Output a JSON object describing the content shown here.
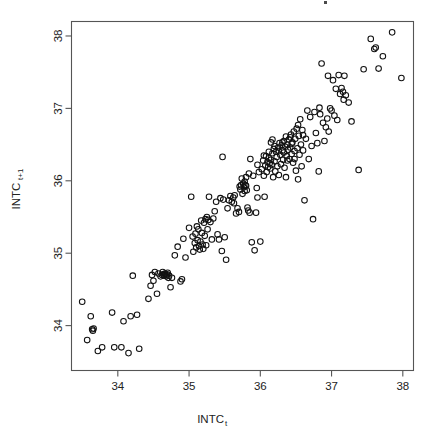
{
  "figure": {
    "kind": "scatterplot",
    "background_color": "#ffffff",
    "width": 429,
    "height": 436,
    "title": ""
  },
  "axes": {
    "frame_color": "#555555",
    "x": {
      "label_base": "INTC",
      "label_sub": "t",
      "ticks": [
        "34",
        "35",
        "36",
        "37",
        "38"
      ],
      "tick_values": [
        34,
        35,
        36,
        37,
        38
      ],
      "range": [
        33.35,
        38.15
      ]
    },
    "y": {
      "label_base": "INTC",
      "label_sub": "t+1",
      "ticks": [
        "34",
        "35",
        "36",
        "37",
        "38"
      ],
      "tick_values": [
        34,
        35,
        36,
        37,
        38
      ],
      "range": [
        33.38,
        38.2
      ]
    }
  },
  "marker": {
    "shape": "open-circle",
    "radius_px": 2.8,
    "stroke_color": "#111111",
    "stroke_width": 1.05,
    "fill": "none"
  },
  "chart_data": {
    "type": "scatter",
    "title": "",
    "xlabel": "INTC_t",
    "ylabel": "INTC_t+1",
    "xlim": [
      33.35,
      38.15
    ],
    "ylim": [
      33.38,
      38.2
    ],
    "grid": false,
    "legend": false,
    "series": [
      {
        "name": "INTC lag-1 scatter",
        "marker": "open-circle",
        "color": "#111111",
        "n_points": 232,
        "points": [
          [
            33.5,
            34.33
          ],
          [
            33.57,
            33.8
          ],
          [
            33.62,
            34.13
          ],
          [
            33.64,
            33.95
          ],
          [
            33.65,
            33.93
          ],
          [
            33.66,
            33.96
          ],
          [
            33.72,
            33.65
          ],
          [
            33.78,
            33.7
          ],
          [
            33.92,
            34.18
          ],
          [
            33.95,
            33.7
          ],
          [
            34.05,
            33.7
          ],
          [
            34.08,
            34.06
          ],
          [
            34.15,
            33.62
          ],
          [
            34.18,
            34.13
          ],
          [
            34.21,
            34.69
          ],
          [
            34.27,
            34.15
          ],
          [
            34.3,
            33.68
          ],
          [
            34.43,
            34.37
          ],
          [
            34.46,
            34.55
          ],
          [
            34.48,
            34.7
          ],
          [
            34.5,
            34.62
          ],
          [
            34.52,
            34.74
          ],
          [
            34.55,
            34.44
          ],
          [
            34.57,
            34.72
          ],
          [
            34.6,
            34.68
          ],
          [
            34.62,
            34.7
          ],
          [
            34.64,
            34.71
          ],
          [
            34.65,
            34.69
          ],
          [
            34.66,
            34.72
          ],
          [
            34.67,
            34.7
          ],
          [
            34.68,
            34.68
          ],
          [
            34.69,
            34.71
          ],
          [
            34.7,
            34.73
          ],
          [
            34.72,
            34.69
          ],
          [
            34.74,
            34.53
          ],
          [
            34.76,
            34.66
          ],
          [
            34.8,
            34.97
          ],
          [
            34.84,
            35.09
          ],
          [
            34.88,
            34.61
          ],
          [
            34.9,
            34.64
          ],
          [
            34.92,
            35.2
          ],
          [
            34.95,
            34.94
          ],
          [
            35.0,
            35.35
          ],
          [
            35.03,
            35.78
          ],
          [
            35.05,
            35.23
          ],
          [
            35.06,
            35.02
          ],
          [
            35.08,
            35.14
          ],
          [
            35.1,
            35.08
          ],
          [
            35.11,
            35.37
          ],
          [
            35.12,
            35.18
          ],
          [
            35.14,
            35.1
          ],
          [
            35.15,
            35.05
          ],
          [
            35.16,
            35.16
          ],
          [
            35.17,
            35.45
          ],
          [
            35.18,
            35.28
          ],
          [
            35.19,
            35.12
          ],
          [
            35.2,
            35.06
          ],
          [
            35.21,
            35.42
          ],
          [
            35.22,
            35.24
          ],
          [
            35.23,
            35.47
          ],
          [
            35.24,
            35.11
          ],
          [
            35.25,
            35.5
          ],
          [
            35.26,
            35.33
          ],
          [
            35.27,
            35.46
          ],
          [
            35.28,
            35.78
          ],
          [
            35.3,
            35.43
          ],
          [
            35.32,
            35.19
          ],
          [
            35.34,
            35.48
          ],
          [
            35.36,
            35.58
          ],
          [
            35.38,
            35.71
          ],
          [
            35.4,
            35.26
          ],
          [
            35.42,
            35.19
          ],
          [
            35.44,
            35.76
          ],
          [
            35.46,
            35.03
          ],
          [
            35.47,
            36.33
          ],
          [
            35.48,
            35.74
          ],
          [
            35.5,
            35.22
          ],
          [
            35.52,
            34.91
          ],
          [
            35.54,
            35.62
          ],
          [
            35.56,
            35.73
          ],
          [
            35.58,
            35.79
          ],
          [
            35.6,
            35.71
          ],
          [
            35.62,
            35.77
          ],
          [
            35.63,
            35.69
          ],
          [
            35.64,
            35.8
          ],
          [
            35.66,
            35.55
          ],
          [
            35.68,
            35.62
          ],
          [
            35.7,
            35.57
          ],
          [
            35.71,
            35.92
          ],
          [
            35.72,
            35.88
          ],
          [
            35.73,
            35.94
          ],
          [
            35.74,
            36.03
          ],
          [
            35.75,
            35.82
          ],
          [
            35.76,
            35.96
          ],
          [
            35.77,
            35.91
          ],
          [
            35.78,
            35.99
          ],
          [
            35.79,
            35.94
          ],
          [
            35.8,
            36.05
          ],
          [
            35.81,
            35.87
          ],
          [
            35.82,
            35.63
          ],
          [
            35.83,
            35.59
          ],
          [
            35.84,
            36.1
          ],
          [
            35.85,
            35.56
          ],
          [
            35.86,
            36.3
          ],
          [
            35.88,
            35.15
          ],
          [
            35.9,
            36.07
          ],
          [
            35.92,
            35.04
          ],
          [
            35.94,
            35.56
          ],
          [
            35.95,
            35.9
          ],
          [
            35.96,
            35.77
          ],
          [
            35.98,
            36.12
          ],
          [
            36.0,
            35.16
          ],
          [
            36.02,
            36.16
          ],
          [
            36.04,
            36.28
          ],
          [
            36.05,
            36.07
          ],
          [
            36.06,
            35.78
          ],
          [
            36.07,
            36.21
          ],
          [
            36.08,
            36.34
          ],
          [
            36.09,
            36.12
          ],
          [
            36.1,
            36.26
          ],
          [
            36.11,
            36.19
          ],
          [
            36.12,
            36.31
          ],
          [
            36.13,
            36.24
          ],
          [
            36.14,
            36.17
          ],
          [
            36.15,
            36.29
          ],
          [
            36.16,
            36.22
          ],
          [
            36.17,
            36.38
          ],
          [
            36.18,
            36.05
          ],
          [
            36.19,
            36.44
          ],
          [
            36.2,
            36.27
          ],
          [
            36.21,
            36.13
          ],
          [
            36.22,
            36.4
          ],
          [
            36.23,
            36.33
          ],
          [
            36.24,
            36.2
          ],
          [
            36.25,
            36.46
          ],
          [
            36.26,
            36.08
          ],
          [
            36.27,
            36.52
          ],
          [
            36.28,
            36.36
          ],
          [
            36.29,
            36.23
          ],
          [
            36.3,
            36.49
          ],
          [
            36.31,
            36.42
          ],
          [
            36.32,
            36.29
          ],
          [
            36.33,
            36.55
          ],
          [
            36.34,
            36.18
          ],
          [
            36.35,
            36.47
          ],
          [
            36.36,
            36.61
          ],
          [
            36.37,
            36.34
          ],
          [
            36.38,
            36.5
          ],
          [
            36.39,
            36.43
          ],
          [
            36.4,
            36.57
          ],
          [
            36.41,
            36.3
          ],
          [
            36.42,
            36.46
          ],
          [
            36.43,
            36.64
          ],
          [
            36.44,
            36.37
          ],
          [
            36.45,
            36.53
          ],
          [
            36.46,
            36.25
          ],
          [
            36.47,
            36.68
          ],
          [
            36.48,
            36.41
          ],
          [
            36.49,
            36.58
          ],
          [
            36.5,
            36.14
          ],
          [
            36.51,
            36.72
          ],
          [
            36.52,
            36.45
          ],
          [
            36.53,
            36.02
          ],
          [
            36.54,
            36.62
          ],
          [
            36.55,
            36.36
          ],
          [
            36.56,
            36.85
          ],
          [
            36.57,
            36.5
          ],
          [
            36.58,
            36.2
          ],
          [
            36.59,
            36.7
          ],
          [
            36.6,
            36.42
          ],
          [
            36.62,
            35.73
          ],
          [
            36.64,
            36.58
          ],
          [
            36.66,
            36.97
          ],
          [
            36.68,
            36.3
          ],
          [
            36.7,
            36.88
          ],
          [
            36.72,
            36.48
          ],
          [
            36.74,
            35.47
          ],
          [
            36.76,
            36.95
          ],
          [
            36.78,
            36.66
          ],
          [
            36.8,
            36.52
          ],
          [
            36.82,
            36.13
          ],
          [
            36.84,
            36.92
          ],
          [
            36.86,
            37.62
          ],
          [
            36.88,
            36.8
          ],
          [
            36.9,
            36.55
          ],
          [
            36.92,
            36.74
          ],
          [
            36.94,
            36.86
          ],
          [
            36.95,
            37.45
          ],
          [
            36.96,
            36.68
          ],
          [
            36.98,
            37.0
          ],
          [
            37.0,
            36.97
          ],
          [
            37.02,
            37.39
          ],
          [
            37.04,
            36.9
          ],
          [
            37.06,
            37.27
          ],
          [
            37.08,
            36.84
          ],
          [
            37.1,
            37.46
          ],
          [
            37.12,
            37.2
          ],
          [
            37.14,
            37.28
          ],
          [
            37.16,
            37.23
          ],
          [
            37.18,
            37.45
          ],
          [
            37.2,
            37.18
          ],
          [
            37.24,
            37.08
          ],
          [
            37.28,
            36.82
          ],
          [
            37.38,
            36.15
          ],
          [
            37.45,
            37.54
          ],
          [
            37.55,
            37.96
          ],
          [
            37.6,
            37.82
          ],
          [
            37.62,
            37.84
          ],
          [
            37.66,
            37.55
          ],
          [
            37.72,
            37.72
          ],
          [
            37.85,
            38.05
          ],
          [
            37.98,
            37.42
          ],
          [
            36.31,
            36.53
          ],
          [
            36.33,
            36.39
          ],
          [
            36.2,
            36.48
          ],
          [
            36.12,
            36.4
          ],
          [
            36.38,
            36.28
          ],
          [
            36.42,
            36.6
          ],
          [
            36.05,
            36.35
          ],
          [
            36.44,
            36.51
          ],
          [
            35.78,
            35.86
          ],
          [
            35.8,
            35.93
          ],
          [
            35.09,
            35.27
          ],
          [
            35.13,
            35.33
          ],
          [
            34.63,
            34.74
          ],
          [
            34.71,
            34.66
          ],
          [
            36.26,
            36.41
          ],
          [
            36.48,
            36.3
          ],
          [
            36.6,
            36.63
          ],
          [
            36.15,
            36.53
          ],
          [
            35.96,
            36.22
          ],
          [
            36.17,
            36.57
          ],
          [
            36.36,
            36.05
          ],
          [
            36.53,
            36.77
          ],
          [
            37.17,
            37.12
          ],
          [
            36.83,
            37.01
          ]
        ]
      }
    ]
  }
}
